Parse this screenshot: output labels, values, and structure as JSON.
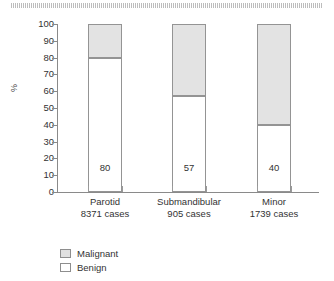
{
  "figure": {
    "top_strip_name": "scan-artifact-strip"
  },
  "chart_data": {
    "type": "bar",
    "subtype": "stacked-100-percent",
    "title": "",
    "subtitle": "",
    "xlabel": "",
    "ylabel": "%",
    "ylim": [
      0,
      100
    ],
    "ytick_labels": [
      "100",
      "90",
      "80",
      "70",
      "60",
      "50",
      "40",
      "30",
      "20",
      "10",
      "0"
    ],
    "ytick_values": [
      100,
      90,
      80,
      70,
      60,
      50,
      40,
      30,
      20,
      10,
      0
    ],
    "grid": false,
    "legend_position": "below-left",
    "categories": [
      "Parotid",
      "Submandibular",
      "Minor"
    ],
    "category_sublabels": [
      "8371 cases",
      "905 cases",
      "1739 cases"
    ],
    "case_counts": [
      8371,
      905,
      1739
    ],
    "series": [
      {
        "name": "Malignant",
        "color": "#e3e3e3",
        "values": [
          20,
          43,
          60
        ]
      },
      {
        "name": "Benign",
        "color": "#ffffff",
        "values": [
          80,
          57,
          40
        ]
      }
    ],
    "bar_value_labels": [
      "80",
      "57",
      "40"
    ],
    "bar_value_series": "Benign"
  },
  "legend": {
    "items": [
      {
        "label": "Malignant",
        "swatch": "malignant"
      },
      {
        "label": "Benign",
        "swatch": "benign"
      }
    ]
  }
}
